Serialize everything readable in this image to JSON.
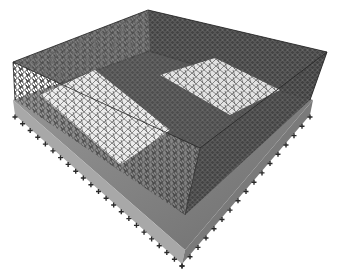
{
  "image": {
    "description": "3D wireframe finite-element mesh of a rectangular box structure with interior walls, sitting on a gray base slab with support markers along the edges",
    "background": "#ffffff",
    "mesh_color": "#1a1a1a",
    "slab_color": "#8c8c8c",
    "slab_light": "#b8b8b8",
    "support_marker_color": "#2a2a2a"
  },
  "geometry": {
    "top_box": {
      "left": [
        13,
        62
      ],
      "back": [
        148,
        10
      ],
      "right": [
        327,
        52
      ],
      "front": [
        200,
        148
      ]
    },
    "box_bottom": {
      "left": [
        15,
        100
      ],
      "back": [
        150,
        52
      ],
      "right": [
        310,
        100
      ],
      "front": [
        185,
        215
      ]
    },
    "slab_top": {
      "left": [
        13,
        100
      ],
      "back": [
        150,
        50
      ],
      "right": [
        313,
        100
      ],
      "front": [
        185,
        250
      ]
    },
    "slab_bottom": {
      "left": [
        15,
        115
      ],
      "right": [
        310,
        115
      ],
      "front": [
        182,
        264
      ]
    }
  }
}
